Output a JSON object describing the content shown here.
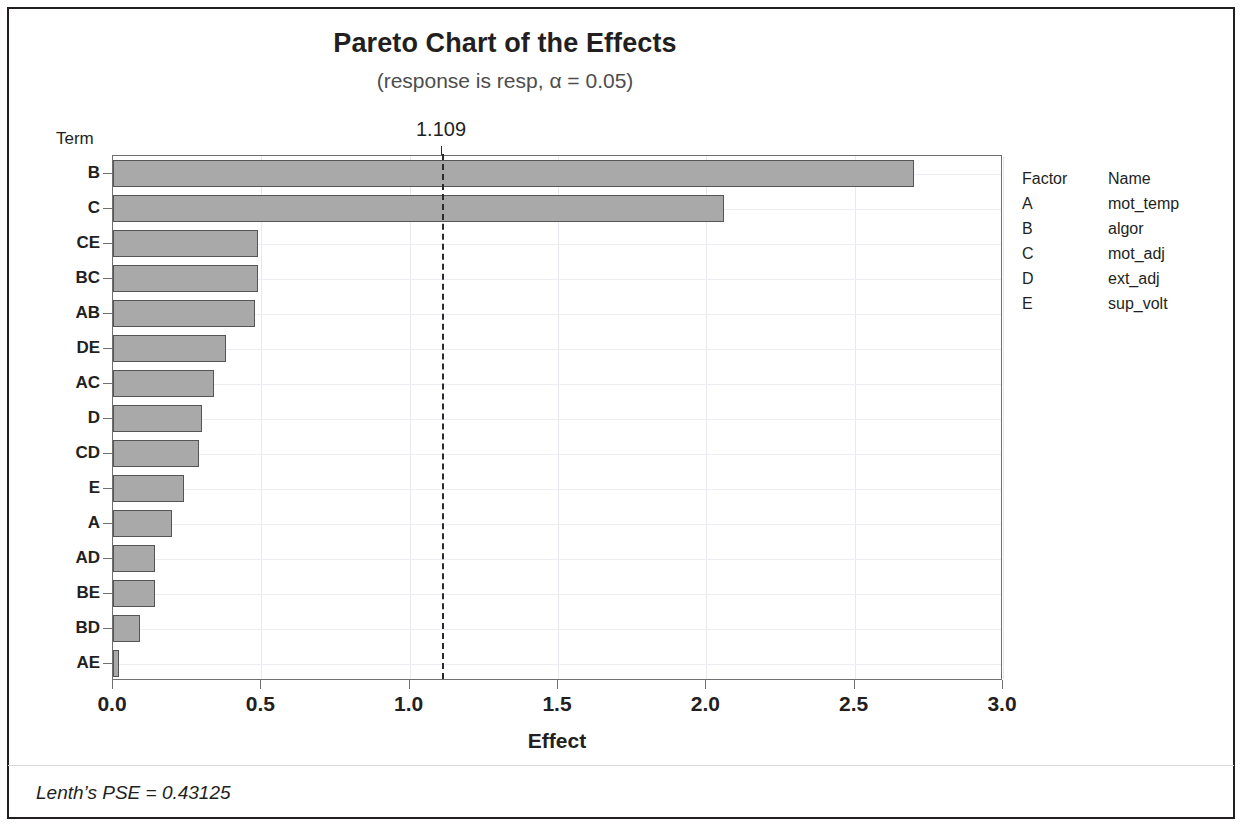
{
  "chart_data": {
    "type": "bar",
    "orientation": "horizontal",
    "title": "Pareto Chart of the Effects",
    "subtitle": "(response is resp, α = 0.05)",
    "xlabel": "Effect",
    "ylabel": "Term",
    "xlim": [
      0.0,
      3.0
    ],
    "xticks": [
      "0.0",
      "0.5",
      "1.0",
      "1.5",
      "2.0",
      "2.5",
      "3.0"
    ],
    "xtick_values": [
      0.0,
      0.5,
      1.0,
      1.5,
      2.0,
      2.5,
      3.0
    ],
    "grid": true,
    "legend_position": "right",
    "categories": [
      "B",
      "C",
      "CE",
      "BC",
      "AB",
      "DE",
      "AC",
      "D",
      "CD",
      "E",
      "A",
      "AD",
      "BE",
      "BD",
      "AE"
    ],
    "values": [
      2.7,
      2.06,
      0.49,
      0.49,
      0.48,
      0.38,
      0.34,
      0.3,
      0.29,
      0.24,
      0.2,
      0.14,
      0.14,
      0.09,
      0.02
    ],
    "reference_line": {
      "value": 1.109,
      "label": "1.109",
      "style": "dashed"
    },
    "annotation": "Lenth's PSE = 0.43125",
    "bar_color": "#a9a9a9",
    "bar_border_color": "#555555"
  },
  "title": "Pareto Chart of the Effects",
  "subtitle": "(response is resp, α = 0.05)",
  "axes": {
    "y_axis_title": "Term",
    "x_axis_title": "Effect"
  },
  "reference": {
    "label": "1.109"
  },
  "legend": {
    "header_factor": "Factor",
    "header_name": "Name",
    "rows": [
      {
        "factor": "A",
        "name": "mot_temp"
      },
      {
        "factor": "B",
        "name": "algor"
      },
      {
        "factor": "C",
        "name": "mot_adj"
      },
      {
        "factor": "D",
        "name": "ext_adj"
      },
      {
        "factor": "E",
        "name": "sup_volt"
      }
    ]
  },
  "footnote": "Lenth’s PSE = 0.43125"
}
